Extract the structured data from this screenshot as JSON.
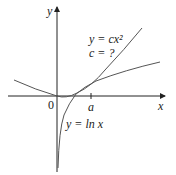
{
  "axes": {
    "x_label": "x",
    "y_label": "y",
    "origin_label": "0",
    "tick_label": "a"
  },
  "curves": [
    {
      "name": "parabola",
      "label_line1": "y = cx²",
      "label_line2": "c = ?"
    },
    {
      "name": "log",
      "label": "y = ln x"
    }
  ],
  "colors": {
    "axis": "#222222",
    "curve": "#555555"
  }
}
